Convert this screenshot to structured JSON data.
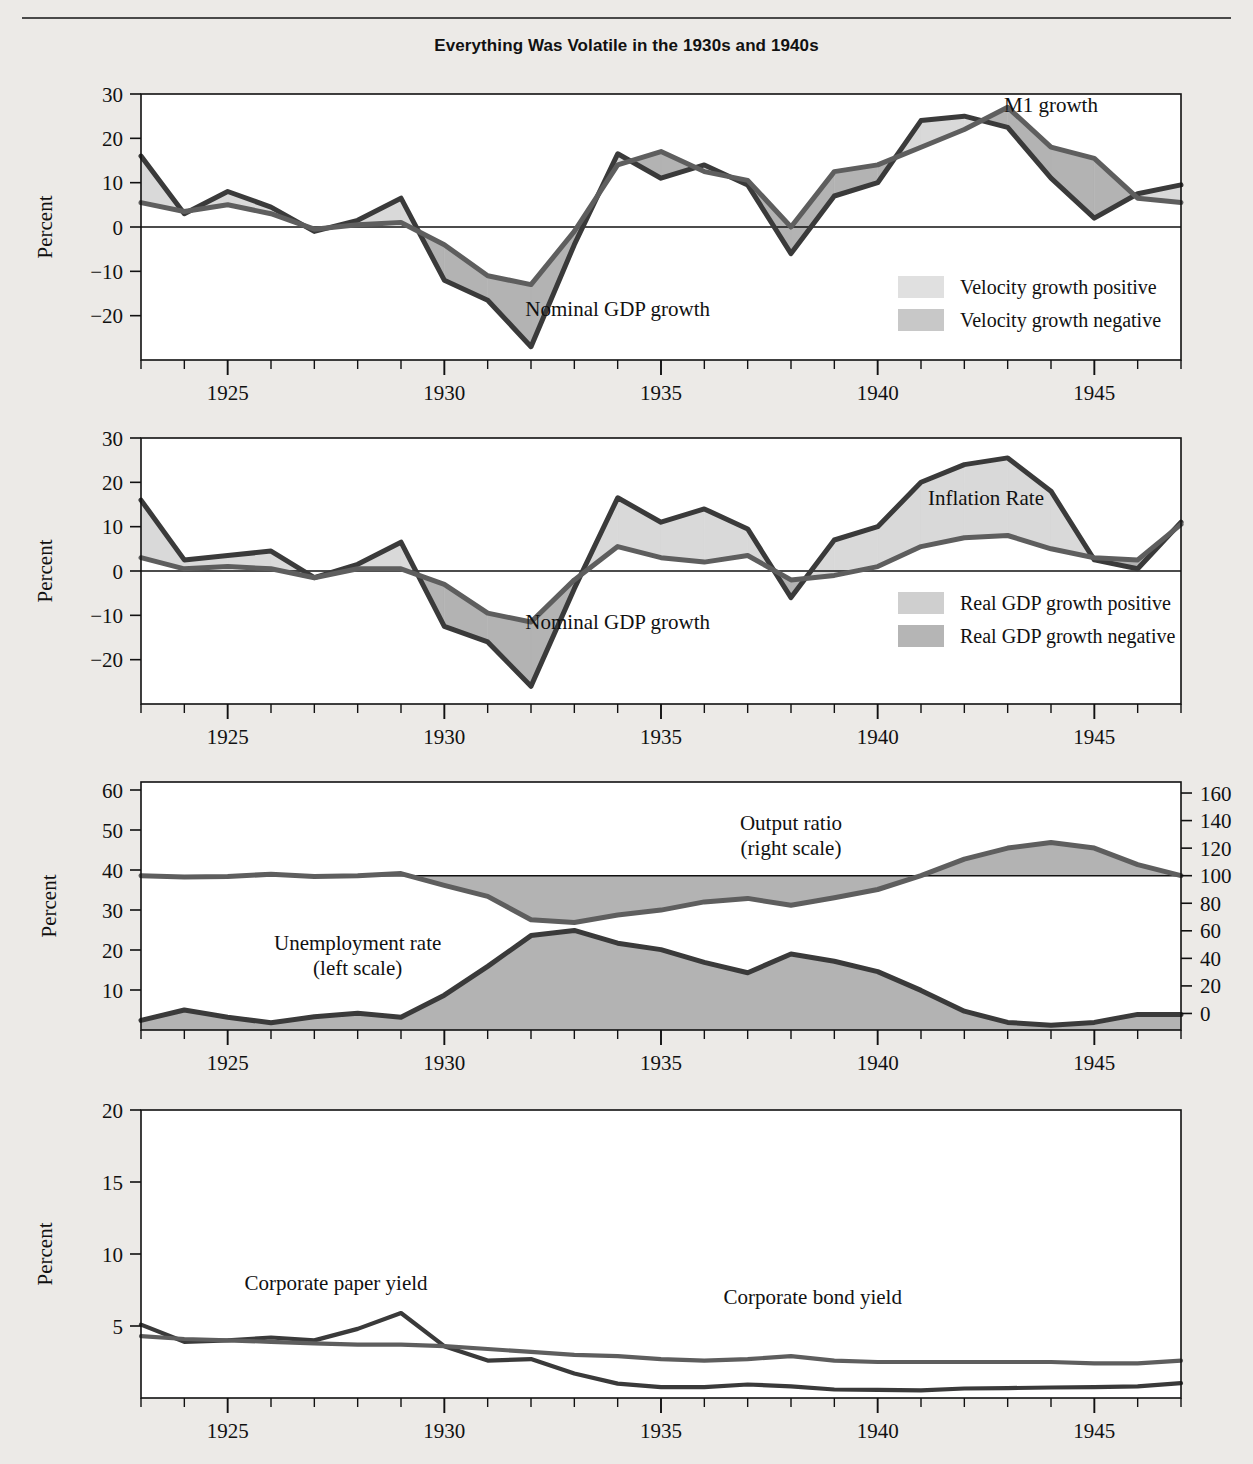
{
  "figure": {
    "title": "Everything Was Volatile in the 1930s and 1940s",
    "background_color": "#eceae7",
    "plot_background_color": "#ffffff",
    "line_dark_color": "#3a3a3a",
    "line_mid_color": "#5e5e5e",
    "fill_light_color": "#d9d9d9",
    "fill_dark_color": "#b3b3b3"
  },
  "axes": {
    "x_label_none": "",
    "x_ticks_major": [
      "1925",
      "1930",
      "1935",
      "1940",
      "1945"
    ],
    "x_min": 1923,
    "x_max": 1947,
    "y_label": "Percent",
    "y_label_right": "Percent"
  },
  "panels": [
    {
      "id": "panel-money",
      "y_ticks": [
        "30",
        "20",
        "10",
        "0",
        "−10",
        "−20"
      ],
      "y_label": "Percent",
      "series_labels": [
        {
          "name": "m1-growth-label",
          "text": "M1 growth"
        },
        {
          "name": "nominal-gdp-growth-label",
          "text": "Nominal GDP growth"
        }
      ],
      "legend": [
        {
          "name": "legend-velocity-positive",
          "text": "Velocity growth positive",
          "swatch": "#e0e0e0"
        },
        {
          "name": "legend-velocity-negative",
          "text": "Velocity growth negative",
          "swatch": "#c8c8c8"
        }
      ]
    },
    {
      "id": "panel-inflation",
      "y_ticks": [
        "30",
        "20",
        "10",
        "0",
        "−10",
        "−20"
      ],
      "y_label": "Percent",
      "series_labels": [
        {
          "name": "inflation-rate-label",
          "text": "Inflation Rate"
        },
        {
          "name": "nominal-gdp-growth-label",
          "text": "Nominal GDP growth"
        }
      ],
      "legend": [
        {
          "name": "legend-real-gdp-positive",
          "text": "Real GDP growth positive",
          "swatch": "#cfcfcf"
        },
        {
          "name": "legend-real-gdp-negative",
          "text": "Real GDP growth negative",
          "swatch": "#b5b5b5"
        }
      ]
    },
    {
      "id": "panel-unemployment-output",
      "y_ticks_left": [
        "60",
        "50",
        "40",
        "30",
        "20",
        "10"
      ],
      "y_ticks_right": [
        "160",
        "140",
        "120",
        "100",
        "80",
        "60",
        "40",
        "20",
        "0"
      ],
      "y_label_left": "Percent",
      "y_label_right": "Percent",
      "series_labels": [
        {
          "name": "output-ratio-label",
          "line1": "Output ratio",
          "line2": "(right scale)"
        },
        {
          "name": "unemployment-rate-label",
          "line1": "Unemployment rate",
          "line2": "(left scale)"
        }
      ]
    },
    {
      "id": "panel-yields",
      "y_ticks": [
        "20",
        "15",
        "10",
        "5"
      ],
      "y_label": "Percent",
      "series_labels": [
        {
          "name": "corporate-paper-yield-label",
          "text": "Corporate paper yield"
        },
        {
          "name": "corporate-bond-yield-label",
          "text": "Corporate bond yield"
        }
      ]
    }
  ],
  "chart_data": [
    {
      "type": "area",
      "id": "panel-money",
      "title": "Everything Was Volatile in the 1930s and 1940s",
      "xlabel": "",
      "ylabel": "Percent",
      "ylim": [
        -30,
        30
      ],
      "xlim": [
        1923,
        1947
      ],
      "yticks": [
        -20,
        -10,
        0,
        10,
        20,
        30
      ],
      "grid": false,
      "legend": [
        "Velocity growth positive",
        "Velocity growth negative"
      ],
      "legend_position": "inside-right",
      "x": [
        1923,
        1924,
        1925,
        1926,
        1927,
        1928,
        1929,
        1930,
        1931,
        1932,
        1933,
        1934,
        1935,
        1936,
        1937,
        1938,
        1939,
        1940,
        1941,
        1942,
        1943,
        1944,
        1945,
        1946,
        1947
      ],
      "series": [
        {
          "name": "Nominal GDP growth",
          "values": [
            16.0,
            3.0,
            8.0,
            4.5,
            -1.0,
            1.5,
            6.5,
            -12.0,
            -16.5,
            -27.0,
            -4.0,
            16.5,
            11.0,
            14.0,
            9.5,
            -6.0,
            7.0,
            10.0,
            24.0,
            25.0,
            22.5,
            11.0,
            2.0,
            7.5,
            9.5
          ]
        },
        {
          "name": "M1 growth",
          "values": [
            5.5,
            3.5,
            5.0,
            3.0,
            -0.5,
            0.5,
            1.0,
            -4.0,
            -11.0,
            -13.0,
            -1.0,
            14.0,
            17.0,
            12.5,
            10.5,
            0.0,
            12.5,
            14.0,
            18.0,
            22.0,
            27.0,
            18.0,
            15.5,
            6.5,
            5.5
          ]
        }
      ],
      "annotations": [
        {
          "text": "M1 growth",
          "x": 1944.0,
          "y": 26.0
        },
        {
          "text": "Nominal GDP growth",
          "x": 1934.0,
          "y": -20.0
        }
      ]
    },
    {
      "type": "area",
      "id": "panel-inflation",
      "xlabel": "",
      "ylabel": "Percent",
      "ylim": [
        -30,
        30
      ],
      "xlim": [
        1923,
        1947
      ],
      "yticks": [
        -20,
        -10,
        0,
        10,
        20,
        30
      ],
      "grid": false,
      "legend": [
        "Real GDP growth positive",
        "Real GDP growth negative"
      ],
      "legend_position": "inside-right",
      "x": [
        1923,
        1924,
        1925,
        1926,
        1927,
        1928,
        1929,
        1930,
        1931,
        1932,
        1933,
        1934,
        1935,
        1936,
        1937,
        1938,
        1939,
        1940,
        1941,
        1942,
        1943,
        1944,
        1945,
        1946,
        1947
      ],
      "series": [
        {
          "name": "Nominal GDP growth",
          "values": [
            16.0,
            2.5,
            3.5,
            4.5,
            -1.5,
            1.5,
            6.5,
            -12.5,
            -16.0,
            -26.0,
            -4.0,
            16.5,
            11.0,
            14.0,
            9.5,
            -6.0,
            7.0,
            10.0,
            20.0,
            24.0,
            25.5,
            18.0,
            2.5,
            0.5,
            11.0
          ]
        },
        {
          "name": "Inflation Rate",
          "values": [
            3.0,
            0.5,
            1.0,
            0.5,
            -1.5,
            0.5,
            0.5,
            -3.0,
            -9.5,
            -11.5,
            -2.0,
            5.5,
            3.0,
            2.0,
            3.5,
            -2.0,
            -1.0,
            1.0,
            5.5,
            7.5,
            8.0,
            5.0,
            3.0,
            2.5,
            10.5
          ]
        }
      ],
      "annotations": [
        {
          "text": "Inflation Rate",
          "x": 1942.5,
          "y": 15.0
        },
        {
          "text": "Nominal GDP growth",
          "x": 1934.0,
          "y": -13.0
        }
      ]
    },
    {
      "type": "area",
      "id": "panel-unemployment-output",
      "xlabel": "",
      "ylabel": "Percent",
      "ylabel_right": "Percent",
      "ylim": [
        0,
        62
      ],
      "ylim_right": [
        -12,
        168
      ],
      "xlim": [
        1923,
        1947
      ],
      "yticks": [
        10,
        20,
        30,
        40,
        50,
        60
      ],
      "yticks_right": [
        0,
        20,
        40,
        60,
        80,
        100,
        120,
        140,
        160
      ],
      "grid": false,
      "reference_line_right": 100,
      "x": [
        1923,
        1924,
        1925,
        1926,
        1927,
        1928,
        1929,
        1930,
        1931,
        1932,
        1933,
        1934,
        1935,
        1936,
        1937,
        1938,
        1939,
        1940,
        1941,
        1942,
        1943,
        1944,
        1945,
        1946,
        1947
      ],
      "series": [
        {
          "name": "Unemployment rate (left scale)",
          "axis": "left",
          "values": [
            2.4,
            5.0,
            3.2,
            1.8,
            3.3,
            4.2,
            3.2,
            8.7,
            15.9,
            23.6,
            24.9,
            21.7,
            20.1,
            16.9,
            14.3,
            19.0,
            17.2,
            14.6,
            9.9,
            4.7,
            1.9,
            1.2,
            1.9,
            3.9,
            3.9
          ]
        },
        {
          "name": "Output ratio (right scale)",
          "axis": "right",
          "values": [
            100.0,
            99.0,
            99.5,
            101.0,
            99.5,
            100.0,
            101.5,
            93.0,
            85.0,
            68.0,
            66.0,
            71.5,
            75.0,
            81.0,
            83.5,
            78.5,
            84.0,
            90.0,
            100.0,
            112.0,
            120.0,
            124.0,
            120.0,
            108.0,
            100.0
          ]
        }
      ],
      "annotations": [
        {
          "text": "Output ratio (right scale)",
          "x": 1938.0,
          "y": 50.0
        },
        {
          "text": "Unemployment rate (left scale)",
          "x": 1928.0,
          "y": 20.0
        }
      ]
    },
    {
      "type": "line",
      "id": "panel-yields",
      "xlabel": "",
      "ylabel": "Percent",
      "ylim": [
        0,
        20
      ],
      "xlim": [
        1923,
        1947
      ],
      "yticks": [
        5,
        10,
        15,
        20
      ],
      "grid": false,
      "x": [
        1923,
        1924,
        1925,
        1926,
        1927,
        1928,
        1929,
        1930,
        1931,
        1932,
        1933,
        1934,
        1935,
        1936,
        1937,
        1938,
        1939,
        1940,
        1941,
        1942,
        1943,
        1944,
        1945,
        1946,
        1947
      ],
      "series": [
        {
          "name": "Corporate paper yield",
          "values": [
            5.1,
            3.9,
            4.0,
            4.2,
            4.0,
            4.8,
            5.9,
            3.6,
            2.6,
            2.7,
            1.7,
            1.0,
            0.75,
            0.75,
            0.94,
            0.81,
            0.59,
            0.56,
            0.53,
            0.66,
            0.69,
            0.73,
            0.75,
            0.81,
            1.03
          ]
        },
        {
          "name": "Corporate bond yield",
          "values": [
            4.3,
            4.1,
            4.0,
            3.9,
            3.8,
            3.7,
            3.7,
            3.6,
            3.4,
            3.2,
            3.0,
            2.9,
            2.7,
            2.6,
            2.7,
            2.9,
            2.6,
            2.5,
            2.5,
            2.5,
            2.5,
            2.5,
            2.4,
            2.4,
            2.6
          ]
        }
      ],
      "annotations": [
        {
          "text": "Corporate paper yield",
          "x": 1927.5,
          "y": 7.5
        },
        {
          "text": "Corporate bond yield",
          "x": 1938.5,
          "y": 6.5
        }
      ]
    }
  ]
}
